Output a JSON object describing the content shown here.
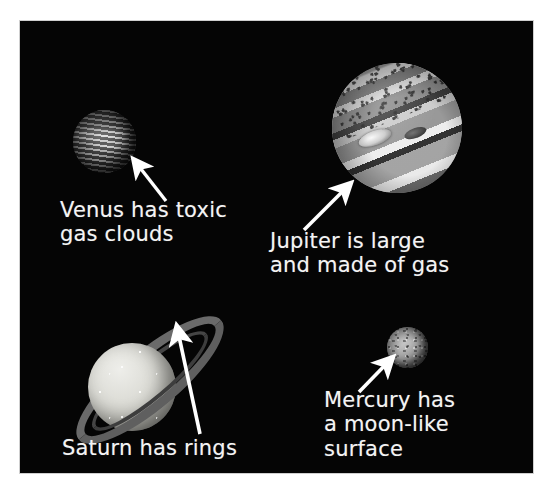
{
  "image": {
    "kind": "astronomy-diagram",
    "background_color": "#ffffff",
    "panel_color": "#050505",
    "label_color": "#f4f4f4",
    "arrow_color": "#ffffff"
  },
  "panel": {
    "x": 20,
    "y": 21,
    "width": 513,
    "height": 452
  },
  "planets": [
    {
      "key": "venus",
      "name": "venus-planet",
      "cx": 104,
      "cy": 140,
      "diameter": 63,
      "base_color": "#5d5d5d",
      "band_color": "#d8d8d8",
      "description": "mottled dark grey globe with bright streaky cloud bands"
    },
    {
      "key": "jupiter",
      "name": "jupiter-planet",
      "cx": 397,
      "cy": 128,
      "diameter": 130,
      "base_color": "#9a9a9a",
      "band_color": "#ededed",
      "dark_band_color": "#4a4a4a",
      "description": "large banded gas giant with diagonal light and dark stripes and speckled polar region"
    },
    {
      "key": "saturn",
      "name": "saturn-planet",
      "cx": 112,
      "cy": 366,
      "diameter": 88,
      "base_color": "#d5d5d5",
      "ring_color": "#6f6f6f",
      "ring_tilt_deg": -40,
      "ring_outer_w": 186,
      "ring_outer_h": 56,
      "description": "pale yellow-grey globe encircled by tilted rings"
    },
    {
      "key": "mercury",
      "name": "mercury-planet",
      "cx": 408,
      "cy": 348,
      "diameter": 41,
      "base_color": "#8f8f8f",
      "description": "small grey cratered moon-like sphere"
    }
  ],
  "arrows": [
    {
      "key": "venus-arrow",
      "name": "venus-arrow",
      "from_x": 166,
      "from_y": 201,
      "to_x": 132,
      "to_y": 158,
      "points_to": "venus"
    },
    {
      "key": "jupiter-arrow",
      "name": "jupiter-arrow",
      "from_x": 304,
      "from_y": 230,
      "to_x": 348,
      "to_y": 182,
      "points_to": "jupiter"
    },
    {
      "key": "saturn-arrow",
      "name": "saturn-arrow",
      "from_x": 200,
      "from_y": 434,
      "to_x": 177,
      "to_y": 325,
      "points_to": "saturn"
    },
    {
      "key": "mercury-arrow",
      "name": "mercury-arrow",
      "from_x": 359,
      "from_y": 392,
      "to_x": 391,
      "to_y": 357,
      "points_to": "mercury"
    }
  ],
  "captions": {
    "venus": {
      "text": "Venus has toxic\ngas clouds",
      "x": 60,
      "y": 198,
      "width": 230
    },
    "jupiter": {
      "text": "Jupiter is large\nand made of gas",
      "x": 270,
      "y": 229,
      "width": 260
    },
    "saturn": {
      "text": "Saturn has rings",
      "x": 62,
      "y": 436,
      "width": 240
    },
    "mercury": {
      "text": "Mercury has\na moon-like\nsurface",
      "x": 324,
      "y": 388,
      "width": 200
    }
  }
}
